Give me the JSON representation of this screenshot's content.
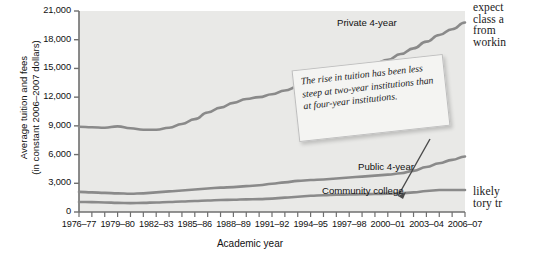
{
  "figure": {
    "callout_text": "The rise in tuition has been less steep at two-year institutions than at four-year institutions.",
    "page_text_top": "expect\nclass a\nfrom  \nworkin",
    "page_text_bottom": "likely\ntory tr"
  },
  "chart_data": {
    "type": "line",
    "title": "",
    "xlabel": "Academic year",
    "ylabel": "Average tuition and fees\n(in constant 2006–2007 dollars)",
    "ylim": [
      0,
      21000
    ],
    "yticks": [
      0,
      3000,
      6000,
      9000,
      12000,
      15000,
      18000,
      21000
    ],
    "ytick_labels": [
      "0",
      "3,000",
      "6,000",
      "9,000",
      "12,000",
      "15,000",
      "18,000",
      "21,000"
    ],
    "grid": false,
    "legend_position": "inline-labels",
    "x": [
      "1976–77",
      "1977–78",
      "1978–79",
      "1979–80",
      "1980–81",
      "1981–82",
      "1982–83",
      "1983–84",
      "1984–85",
      "1985–86",
      "1986–87",
      "1987–88",
      "1988–89",
      "1989–90",
      "1990–91",
      "1991–92",
      "1992–93",
      "1993–94",
      "1994–95",
      "1995–96",
      "1996–97",
      "1997–98",
      "1998–99",
      "1999–00",
      "2000–01",
      "2001–02",
      "2002–03",
      "2003–04",
      "2004–05",
      "2005–06",
      "2006–07"
    ],
    "xtick_labels": [
      "1976–77",
      "1979–80",
      "1982–83",
      "1985–86",
      "1988–89",
      "1991–92",
      "1994–95",
      "1997–98",
      "2000–01",
      "2003–04",
      "2006–07"
    ],
    "xtick_indices": [
      0,
      3,
      6,
      9,
      12,
      15,
      18,
      21,
      24,
      27,
      30
    ],
    "series": [
      {
        "name": "Private 4-year",
        "color": "#8a8a8a",
        "values": [
          8900,
          8850,
          8800,
          8950,
          8750,
          8600,
          8600,
          8800,
          9200,
          9700,
          10400,
          10900,
          11400,
          11800,
          12000,
          12300,
          12700,
          13100,
          13500,
          13900,
          14300,
          14700,
          15100,
          15500,
          15900,
          16500,
          17100,
          17800,
          18500,
          19100,
          19800
        ]
      },
      {
        "name": "Public 4-year",
        "color": "#8a8a8a",
        "values": [
          2100,
          2050,
          2000,
          1950,
          1900,
          1950,
          2050,
          2150,
          2250,
          2350,
          2450,
          2550,
          2600,
          2700,
          2800,
          2950,
          3100,
          3250,
          3350,
          3400,
          3500,
          3600,
          3700,
          3800,
          3900,
          4050,
          4300,
          4700,
          5100,
          5450,
          5800
        ]
      },
      {
        "name": "Community college",
        "color": "#8a8a8a",
        "values": [
          1050,
          1030,
          1000,
          950,
          930,
          950,
          1000,
          1050,
          1100,
          1150,
          1200,
          1250,
          1280,
          1320,
          1350,
          1400,
          1500,
          1600,
          1700,
          1750,
          1800,
          1830,
          1860,
          1880,
          1900,
          1950,
          2050,
          2200,
          2300,
          2300,
          2300
        ]
      }
    ],
    "annotations": [
      {
        "text": "Private 4-year"
      },
      {
        "text": "Public 4-year"
      },
      {
        "text": "Community college"
      }
    ]
  }
}
